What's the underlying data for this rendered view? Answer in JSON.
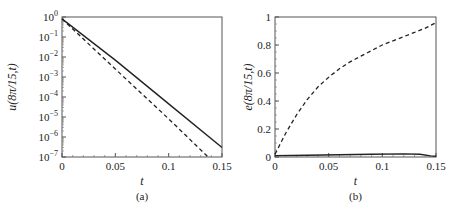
{
  "chart_data": [
    {
      "type": "line",
      "panel": "(a)",
      "xlabel": "t",
      "ylabel": "u(8π/15,t)",
      "xlim": [
        0,
        0.15
      ],
      "ylim": [
        1e-07,
        1
      ],
      "yscale": "log",
      "xticks": [
        "0",
        "0.05",
        "0.1",
        "0.15"
      ],
      "yticks": [
        "10^0",
        "10^-1",
        "10^-2",
        "10^-3",
        "10^-4",
        "10^-5",
        "10^-6",
        "10^-7"
      ],
      "series": [
        {
          "name": "solid",
          "style": "solid",
          "x": [
            0,
            0.05,
            0.1,
            0.15
          ],
          "y": [
            0.8,
            0.007,
            4.5e-05,
            3e-07
          ]
        },
        {
          "name": "dashed",
          "style": "dashed",
          "x": [
            0,
            0.05,
            0.1,
            0.137
          ],
          "y": [
            0.8,
            0.0025,
            8e-06,
            1e-07
          ]
        }
      ]
    },
    {
      "type": "line",
      "panel": "(b)",
      "xlabel": "t",
      "ylabel": "e(8π/15,t)",
      "xlim": [
        0,
        0.15
      ],
      "ylim": [
        0,
        1
      ],
      "xticks": [
        "0",
        "0.05",
        "0.1",
        "0.15"
      ],
      "yticks": [
        "0",
        "0.2",
        "0.4",
        "0.6",
        "0.8",
        "1"
      ],
      "series": [
        {
          "name": "dashed",
          "style": "dashed",
          "x": [
            0,
            0.01,
            0.02,
            0.03,
            0.04,
            0.05,
            0.06,
            0.07,
            0.08,
            0.09,
            0.1,
            0.11,
            0.12,
            0.13,
            0.14,
            0.15
          ],
          "y": [
            0.02,
            0.17,
            0.3,
            0.41,
            0.5,
            0.57,
            0.63,
            0.68,
            0.72,
            0.76,
            0.8,
            0.83,
            0.86,
            0.89,
            0.92,
            0.96
          ]
        },
        {
          "name": "solid",
          "style": "solid",
          "x": [
            0,
            0.03,
            0.06,
            0.09,
            0.12,
            0.135,
            0.145,
            0.15
          ],
          "y": [
            0.01,
            0.012,
            0.016,
            0.02,
            0.022,
            0.02,
            0.008,
            0.005
          ]
        }
      ]
    }
  ],
  "captions": [
    "(a)",
    "(b)"
  ]
}
